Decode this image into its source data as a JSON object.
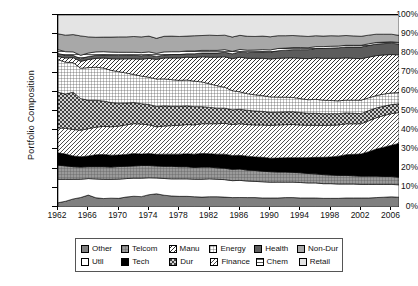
{
  "chart_data": {
    "type": "area",
    "title": "",
    "xlabel": "",
    "ylabel": "Portfolio Composition",
    "ylim": [
      0,
      100
    ],
    "ytick_labels": [
      "100%",
      "90%",
      "80%",
      "70%",
      "60%",
      "50%",
      "40%",
      "30%",
      "20%",
      "10%",
      "0%"
    ],
    "ytick_values": [
      100,
      90,
      80,
      70,
      60,
      50,
      40,
      30,
      20,
      10,
      0
    ],
    "xtick_labels": [
      "1962",
      "1966",
      "1970",
      "1974",
      "1978",
      "1982",
      "1986",
      "1990",
      "1994",
      "1998",
      "2002",
      "2006"
    ],
    "xtick_values": [
      1962,
      1966,
      1970,
      1974,
      1978,
      1982,
      1986,
      1990,
      1994,
      1998,
      2002,
      2006
    ],
    "xlim": [
      1962,
      2007
    ],
    "grid": false,
    "stacked": true,
    "legend_position": "bottom",
    "x": [
      1962,
      1963,
      1964,
      1965,
      1966,
      1967,
      1968,
      1969,
      1970,
      1971,
      1972,
      1973,
      1974,
      1975,
      1976,
      1977,
      1978,
      1979,
      1980,
      1981,
      1982,
      1983,
      1984,
      1985,
      1986,
      1987,
      1988,
      1989,
      1990,
      1991,
      1992,
      1993,
      1994,
      1995,
      1996,
      1997,
      1998,
      1999,
      2000,
      2001,
      2002,
      2003,
      2004,
      2005,
      2006,
      2007
    ],
    "series": [
      {
        "name": "Other",
        "pattern": "solid-gray",
        "color": "#808080",
        "values": [
          2.2,
          3.0,
          4.2,
          5.0,
          6.2,
          4.8,
          4.4,
          4.6,
          4.5,
          5.2,
          5.6,
          5.4,
          6.4,
          7.0,
          6.2,
          5.8,
          5.6,
          5.6,
          5.4,
          5.2,
          5.4,
          5.4,
          5.2,
          5.0,
          5.0,
          5.0,
          5.0,
          4.8,
          4.8,
          4.8,
          5.0,
          5.0,
          4.8,
          4.8,
          4.8,
          4.6,
          4.6,
          4.6,
          4.8,
          4.8,
          4.8,
          4.8,
          5.0,
          5.2,
          5.4,
          5.2
        ]
      },
      {
        "name": "Utll",
        "pattern": "white",
        "color": "#ffffff",
        "values": [
          12.2,
          11.4,
          10.2,
          9.6,
          8.6,
          9.8,
          10.0,
          9.8,
          10.0,
          9.6,
          9.4,
          9.6,
          8.8,
          8.4,
          8.8,
          9.0,
          9.2,
          9.2,
          9.2,
          9.4,
          9.4,
          9.2,
          9.2,
          9.0,
          9.0,
          8.8,
          8.6,
          8.6,
          8.4,
          8.4,
          8.2,
          8.2,
          8.2,
          8.0,
          8.0,
          7.8,
          7.8,
          7.6,
          7.4,
          7.4,
          7.2,
          7.2,
          7.0,
          6.8,
          6.6,
          6.6
        ]
      },
      {
        "name": "Telcom",
        "pattern": "grid-fine-gray",
        "color": "#999999",
        "values": [
          7.4,
          7.0,
          6.6,
          6.4,
          6.2,
          6.4,
          6.6,
          6.4,
          6.6,
          6.4,
          6.4,
          6.6,
          6.4,
          6.4,
          6.4,
          6.6,
          6.4,
          6.4,
          6.2,
          6.4,
          6.2,
          6.0,
          6.0,
          6.0,
          6.0,
          5.8,
          5.8,
          5.6,
          5.6,
          5.4,
          5.4,
          5.2,
          5.2,
          5.0,
          4.8,
          4.8,
          4.6,
          4.6,
          4.6,
          4.4,
          4.4,
          4.4,
          4.4,
          4.2,
          4.2,
          4.0
        ]
      },
      {
        "name": "Tech",
        "pattern": "black",
        "color": "#000000",
        "values": [
          6.4,
          6.2,
          5.6,
          5.4,
          5.6,
          6.2,
          6.4,
          6.2,
          6.0,
          6.2,
          6.4,
          6.0,
          6.2,
          6.2,
          6.4,
          6.4,
          6.6,
          6.8,
          7.0,
          7.2,
          7.0,
          7.2,
          7.4,
          7.4,
          7.2,
          7.4,
          7.2,
          7.4,
          7.2,
          7.4,
          7.6,
          7.8,
          8.0,
          8.4,
          8.8,
          9.2,
          9.6,
          10.2,
          11.0,
          11.4,
          11.8,
          13.0,
          14.4,
          15.6,
          16.6,
          18.0
        ]
      },
      {
        "name": "Finance",
        "pattern": "diag-hatch-light",
        "color": "#d8d8d8",
        "values": [
          13.0,
          13.4,
          13.8,
          14.0,
          14.2,
          14.4,
          14.6,
          14.8,
          15.0,
          15.4,
          15.6,
          15.6,
          15.0,
          14.6,
          14.8,
          15.0,
          15.2,
          15.4,
          15.4,
          15.6,
          15.8,
          16.0,
          16.2,
          16.4,
          16.6,
          16.8,
          17.0,
          17.2,
          17.4,
          17.6,
          17.6,
          17.6,
          17.4,
          17.2,
          17.0,
          17.0,
          16.8,
          16.6,
          16.4,
          16.2,
          16.0,
          16.4,
          16.6,
          16.8,
          16.8,
          16.4
        ]
      },
      {
        "name": "Dur",
        "pattern": "checker-dark",
        "color": "#777777",
        "values": [
          18.6,
          17.8,
          19.4,
          16.6,
          14.8,
          14.0,
          13.2,
          12.6,
          12.0,
          11.4,
          11.0,
          10.6,
          10.6,
          10.8,
          10.6,
          10.2,
          10.0,
          9.8,
          9.6,
          9.0,
          8.6,
          8.2,
          8.0,
          7.8,
          7.6,
          7.6,
          7.4,
          7.2,
          7.0,
          6.8,
          6.8,
          6.8,
          6.6,
          6.4,
          6.4,
          6.2,
          6.2,
          6.0,
          5.8,
          5.6,
          5.4,
          5.4,
          5.2,
          5.0,
          4.8,
          4.6
        ]
      },
      {
        "name": "Energy",
        "pattern": "grid-crosshatch",
        "color": "#e6e6e6",
        "values": [
          17.0,
          16.6,
          15.4,
          16.0,
          17.0,
          17.2,
          17.2,
          16.8,
          16.4,
          15.6,
          14.6,
          14.4,
          14.2,
          14.6,
          14.2,
          14.0,
          13.6,
          13.6,
          13.4,
          13.0,
          12.4,
          11.8,
          11.0,
          10.2,
          9.2,
          8.8,
          8.6,
          8.4,
          8.2,
          8.0,
          7.8,
          7.6,
          7.4,
          7.2,
          7.4,
          7.2,
          7.0,
          6.8,
          6.8,
          7.0,
          7.2,
          6.8,
          6.6,
          6.4,
          6.2,
          6.0
        ]
      },
      {
        "name": "Manu",
        "pattern": "diag-hatch-med",
        "color": "#c8c8c8",
        "values": [
          1.6,
          2.2,
          2.6,
          3.6,
          4.2,
          4.6,
          5.2,
          6.0,
          6.6,
          7.4,
          8.2,
          8.8,
          9.8,
          10.4,
          11.0,
          11.4,
          11.8,
          12.0,
          12.4,
          13.2,
          14.0,
          15.0,
          16.0,
          17.0,
          18.2,
          18.8,
          19.4,
          19.8,
          20.2,
          20.6,
          20.8,
          21.0,
          21.4,
          21.8,
          22.0,
          22.2,
          22.4,
          22.6,
          22.4,
          22.2,
          22.0,
          21.6,
          21.2,
          20.8,
          20.4,
          20.0
        ]
      },
      {
        "name": "Health",
        "pattern": "solid-darkgray",
        "color": "#595959",
        "values": [
          1.6,
          1.4,
          1.2,
          1.4,
          1.6,
          1.6,
          1.6,
          1.8,
          1.8,
          1.8,
          1.8,
          1.8,
          1.8,
          1.6,
          1.6,
          1.8,
          1.8,
          1.8,
          2.0,
          2.0,
          2.2,
          2.2,
          2.4,
          2.6,
          2.8,
          3.0,
          3.2,
          3.4,
          3.6,
          4.0,
          4.2,
          4.4,
          4.6,
          4.8,
          5.0,
          5.2,
          5.4,
          5.6,
          5.8,
          6.0,
          6.2,
          6.2,
          6.2,
          6.0,
          6.0,
          5.8
        ]
      },
      {
        "name": "Chem",
        "pattern": "horiz-lines",
        "color": "#f0f0f0",
        "values": [
          2.0,
          1.9,
          1.8,
          1.8,
          1.8,
          1.8,
          1.7,
          1.7,
          1.7,
          1.6,
          1.6,
          1.6,
          1.6,
          1.6,
          1.6,
          1.5,
          1.5,
          1.5,
          1.5,
          1.4,
          1.4,
          1.4,
          1.4,
          1.3,
          1.3,
          1.3,
          1.2,
          1.2,
          1.2,
          1.2,
          1.1,
          1.1,
          1.1,
          1.0,
          1.0,
          1.0,
          1.0,
          0.9,
          0.9,
          0.9,
          0.9,
          0.9,
          0.8,
          0.8,
          0.8,
          0.8
        ]
      },
      {
        "name": "Non-Dur",
        "pattern": "solid-midgray",
        "color": "#a8a8a8",
        "values": [
          8.2,
          8.6,
          9.0,
          10.2,
          8.4,
          7.6,
          7.6,
          7.8,
          8.0,
          8.0,
          8.2,
          8.2,
          8.2,
          8.0,
          8.2,
          8.2,
          8.0,
          7.8,
          8.0,
          7.8,
          8.0,
          7.8,
          7.6,
          7.6,
          7.4,
          7.4,
          7.2,
          7.2,
          7.0,
          6.8,
          6.6,
          6.4,
          6.2,
          6.0,
          5.8,
          5.6,
          5.6,
          5.4,
          5.2,
          5.0,
          4.8,
          4.6,
          4.4,
          4.2,
          4.0,
          3.8
        ]
      },
      {
        "name": "Retail",
        "pattern": "light-gray",
        "color": "#ebebeb",
        "values": [
          9.8,
          10.5,
          10.2,
          11.0,
          11.4,
          11.6,
          11.5,
          11.5,
          11.4,
          11.4,
          11.2,
          11.4,
          11.0,
          12.4,
          11.2,
          11.1,
          11.3,
          11.1,
          10.9,
          10.8,
          10.6,
          10.8,
          10.6,
          11.7,
          10.7,
          11.3,
          11.4,
          11.2,
          11.6,
          11.0,
          11.0,
          10.9,
          11.1,
          11.4,
          11.0,
          11.2,
          11.0,
          11.1,
          10.9,
          11.1,
          11.3,
          10.7,
          10.2,
          10.2,
          10.2,
          10.8
        ]
      }
    ]
  },
  "legend": {
    "row1": [
      {
        "label": "Other",
        "pattern": "solid-gray"
      },
      {
        "label": "Telcom",
        "pattern": "grid-fine-gray"
      },
      {
        "label": "Manu",
        "pattern": "diag-hatch-med"
      },
      {
        "label": "Energy",
        "pattern": "grid-crosshatch"
      },
      {
        "label": "Health",
        "pattern": "solid-darkgray"
      },
      {
        "label": "Non-Dur",
        "pattern": "solid-midgray"
      }
    ],
    "row2": [
      {
        "label": "Utll",
        "pattern": "white"
      },
      {
        "label": "Tech",
        "pattern": "black"
      },
      {
        "label": "Dur",
        "pattern": "checker-dark"
      },
      {
        "label": "Finance",
        "pattern": "diag-hatch-light"
      },
      {
        "label": "Chem",
        "pattern": "horiz-lines"
      },
      {
        "label": "Retail",
        "pattern": "light-gray"
      }
    ]
  }
}
